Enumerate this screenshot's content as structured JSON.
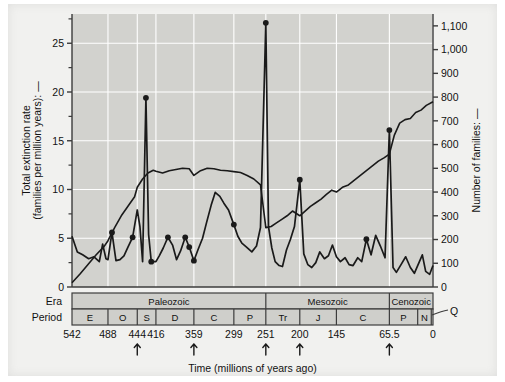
{
  "figure": {
    "time_axis_title": "Time (millions of years ago)",
    "left_axis_title_line1": "Total extinction rate",
    "left_axis_title_line2": "(families per million years): —",
    "right_axis_title": "Number of families: —",
    "era_row_label": "Era",
    "period_row_label": "Period",
    "quaternary_callout": "Q",
    "band_fill": "#cfcfcb",
    "plot_fill": "#d2d2ce",
    "gridline_color": "#ffffff",
    "line_color": "#1a1a1a",
    "frame_color": "#3c3c3c"
  },
  "chart_data": {
    "type": "line",
    "title": "",
    "xlabel": "Time (millions of years ago)",
    "ylabel": "Total extinction rate (families per million years)",
    "y2label": "Number of families",
    "xlim": [
      542,
      0
    ],
    "xreversed": true,
    "ylim": [
      0,
      28
    ],
    "y2lim": [
      0,
      1150
    ],
    "grid": true,
    "legend": "none",
    "x_ticks": [
      542,
      488,
      444,
      416,
      359,
      299,
      251,
      200,
      145,
      65.5,
      0
    ],
    "x_tick_labels": [
      "542",
      "488",
      "444",
      "416",
      "359",
      "299",
      "251",
      "200",
      "145",
      "65.5",
      "0"
    ],
    "y_ticks": [
      0,
      5,
      10,
      15,
      20,
      25
    ],
    "y_tick_labels": [
      "0",
      "5",
      "10",
      "15",
      "20",
      "25"
    ],
    "y_minor_ticks": [
      2.5,
      7.5,
      12.5,
      17.5,
      22.5,
      27.5
    ],
    "y2_ticks": [
      0,
      100,
      200,
      300,
      400,
      500,
      600,
      700,
      800,
      900,
      1000,
      1100
    ],
    "y2_tick_labels": [
      "0",
      "100",
      "200",
      "300",
      "400",
      "500",
      "600",
      "700",
      "800",
      "900",
      "1,000",
      "1,100"
    ],
    "mass_extinction_arrows": [
      444,
      359,
      251,
      200,
      65.5
    ],
    "series": [
      {
        "name": "Total extinction rate",
        "axis": "left",
        "units": "families per million years",
        "x": [
          542,
          534,
          526,
          517,
          509,
          501,
          496,
          491,
          488,
          482,
          476,
          470,
          464,
          458,
          451,
          444,
          440,
          436,
          431,
          427,
          423,
          419,
          416,
          411,
          405,
          398,
          391,
          385,
          379,
          372,
          366,
          359,
          353,
          346,
          340,
          333,
          327,
          320,
          314,
          307,
          299,
          293,
          287,
          280,
          272,
          265,
          259,
          251,
          247,
          242,
          237,
          231,
          226,
          220,
          214,
          208,
          200,
          194,
          188,
          182,
          176,
          170,
          163,
          157,
          151,
          145,
          139,
          132,
          126,
          120,
          113,
          107,
          100,
          93,
          86,
          79,
          72,
          65.5,
          60,
          55,
          48,
          41,
          34,
          28,
          23,
          16,
          11,
          5,
          0
        ],
        "y": [
          5.2,
          3.6,
          3.3,
          2.9,
          3.1,
          2.6,
          4.4,
          2.9,
          2.8,
          5.6,
          2.7,
          2.8,
          3.2,
          4.1,
          5.1,
          7.9,
          6.2,
          2.6,
          19.4,
          5.4,
          2.6,
          2.6,
          2.6,
          3.2,
          4.0,
          5.1,
          4.3,
          2.8,
          3.7,
          5.1,
          4.1,
          2.7,
          3.8,
          5.0,
          6.6,
          8.4,
          9.7,
          9.3,
          8.6,
          7.9,
          6.4,
          5.2,
          4.5,
          4.1,
          3.6,
          4.2,
          6.1,
          27.1,
          6.2,
          4.0,
          2.6,
          2.2,
          2.1,
          3.8,
          4.9,
          6.2,
          11.0,
          3.4,
          2.3,
          2.0,
          2.5,
          3.6,
          2.9,
          3.2,
          4.3,
          3.1,
          2.6,
          3.0,
          2.3,
          2.2,
          3.0,
          2.6,
          4.9,
          3.3,
          5.3,
          4.2,
          3.0,
          16.1,
          2.0,
          1.5,
          2.3,
          3.1,
          2.0,
          1.4,
          2.2,
          3.3,
          1.6,
          1.3,
          2.2
        ],
        "peaks": [
          {
            "x": 431,
            "y": 19.4,
            "label": "End-Ordovician"
          },
          {
            "x": 251,
            "y": 27.1,
            "label": "End-Permian"
          },
          {
            "x": 65.5,
            "y": 16.1,
            "label": "End-Cretaceous"
          },
          {
            "x": 200,
            "y": 11.0,
            "label": "End-Triassic"
          },
          {
            "x": 444,
            "y": 7.9,
            "label": ""
          }
        ],
        "marker_points": [
          {
            "x": 482,
            "y": 5.6
          },
          {
            "x": 451,
            "y": 5.1
          },
          {
            "x": 431,
            "y": 19.4
          },
          {
            "x": 423,
            "y": 2.6
          },
          {
            "x": 398,
            "y": 5.1
          },
          {
            "x": 372,
            "y": 5.1
          },
          {
            "x": 366,
            "y": 4.1
          },
          {
            "x": 359,
            "y": 2.7
          },
          {
            "x": 299,
            "y": 6.4
          },
          {
            "x": 251,
            "y": 27.1
          },
          {
            "x": 200,
            "y": 11.0
          },
          {
            "x": 100,
            "y": 4.9
          },
          {
            "x": 65.5,
            "y": 16.1
          }
        ]
      },
      {
        "name": "Number of families",
        "axis": "right",
        "units": "families",
        "x": [
          542,
          530,
          518,
          506,
          494,
          488,
          478,
          468,
          458,
          448,
          444,
          436,
          428,
          420,
          416,
          406,
          396,
          386,
          376,
          366,
          359,
          349,
          339,
          329,
          319,
          309,
          299,
          289,
          279,
          269,
          259,
          251,
          243,
          235,
          227,
          219,
          211,
          200,
          192,
          184,
          176,
          168,
          160,
          152,
          145,
          136,
          127,
          118,
          109,
          100,
          91,
          82,
          73,
          65.5,
          58,
          50,
          42,
          34,
          26,
          18,
          10,
          0
        ],
        "y": [
          18,
          55,
          95,
          135,
          170,
          195,
          250,
          300,
          340,
          380,
          420,
          455,
          480,
          492,
          488,
          480,
          490,
          495,
          500,
          498,
          470,
          490,
          500,
          498,
          492,
          490,
          486,
          482,
          470,
          455,
          430,
          250,
          255,
          270,
          285,
          300,
          320,
          300,
          320,
          340,
          355,
          370,
          390,
          408,
          400,
          420,
          430,
          450,
          470,
          490,
          510,
          530,
          545,
          560,
          640,
          690,
          705,
          710,
          735,
          745,
          765,
          780
        ]
      }
    ],
    "era_bands": [
      {
        "name": "Paleozoic",
        "start": 542,
        "end": 251
      },
      {
        "name": "Mesozoic",
        "start": 251,
        "end": 65.5
      },
      {
        "name": "Cenozoic",
        "start": 65.5,
        "end": 0
      }
    ],
    "period_bands": [
      {
        "name": "E",
        "full": "Cambrian",
        "start": 542,
        "end": 488
      },
      {
        "name": "O",
        "full": "Ordovician",
        "start": 488,
        "end": 444
      },
      {
        "name": "S",
        "full": "Silurian",
        "start": 444,
        "end": 416
      },
      {
        "name": "D",
        "full": "Devonian",
        "start": 416,
        "end": 359
      },
      {
        "name": "C",
        "full": "Carboniferous",
        "start": 359,
        "end": 299
      },
      {
        "name": "P",
        "full": "Permian",
        "start": 299,
        "end": 251
      },
      {
        "name": "Tr",
        "full": "Triassic",
        "start": 251,
        "end": 200
      },
      {
        "name": "J",
        "full": "Jurassic",
        "start": 200,
        "end": 145
      },
      {
        "name": "C",
        "full": "Cretaceous",
        "start": 145,
        "end": 65.5
      },
      {
        "name": "P",
        "full": "Paleogene",
        "start": 65.5,
        "end": 23
      },
      {
        "name": "N",
        "full": "Neogene",
        "start": 23,
        "end": 2.6
      },
      {
        "name": "Q",
        "full": "Quaternary",
        "start": 2.6,
        "end": 0
      }
    ]
  }
}
